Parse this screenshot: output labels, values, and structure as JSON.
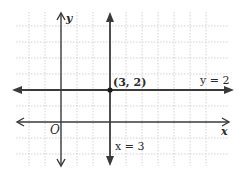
{
  "diagram": {
    "type": "coordinate-plane",
    "axes": {
      "x_label": "x",
      "y_label": "y",
      "origin_label": "O"
    },
    "lines": [
      {
        "equation_label": "y = 2",
        "kind": "horizontal",
        "value": 2
      },
      {
        "equation_label": "x = 3",
        "kind": "vertical",
        "value": 3
      }
    ],
    "points": [
      {
        "label": "(3, 2)",
        "x": 3,
        "y": 2
      }
    ],
    "grid": {
      "on": true,
      "style": "dotted",
      "color": "#c8c8c8"
    },
    "colors": {
      "line": "#3a3a3a",
      "axis": "#3a3a3a",
      "grid": "#c8c8c8"
    }
  }
}
